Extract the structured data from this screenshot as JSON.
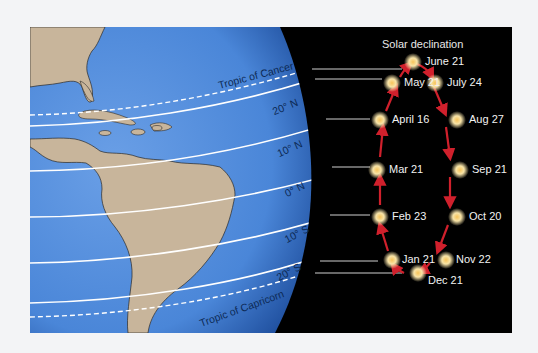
{
  "diagram": {
    "title": "Solar declination",
    "colors": {
      "background": "#000000",
      "ocean": "#4a86d8",
      "land": "#c8b59b",
      "arrow": "#d0202c",
      "sun": "#f4d27a",
      "latitude_line": "#ffffff"
    },
    "latitude_labels": [
      {
        "id": "tropic-cancer",
        "text": "Tropic of Cancer"
      },
      {
        "id": "lat-20n",
        "text": "20° N"
      },
      {
        "id": "lat-10n",
        "text": "10° N"
      },
      {
        "id": "lat-0n",
        "text": "0° N"
      },
      {
        "id": "lat-10s",
        "text": "10° S"
      },
      {
        "id": "lat-20s",
        "text": "20° S"
      },
      {
        "id": "tropic-capricorn",
        "text": "Tropic of Capricorn"
      }
    ],
    "suns": [
      {
        "id": "june21",
        "label": "June 21"
      },
      {
        "id": "may21",
        "label": "May 21"
      },
      {
        "id": "july24",
        "label": "July 24"
      },
      {
        "id": "april16",
        "label": "April 16"
      },
      {
        "id": "aug27",
        "label": "Aug 27"
      },
      {
        "id": "mar21",
        "label": "Mar 21"
      },
      {
        "id": "sep21",
        "label": "Sep 21"
      },
      {
        "id": "feb23",
        "label": "Feb 23"
      },
      {
        "id": "oct20",
        "label": "Oct 20"
      },
      {
        "id": "jan21",
        "label": "Jan 21"
      },
      {
        "id": "nov22",
        "label": "Nov 22"
      },
      {
        "id": "dec21",
        "label": "Dec 21"
      }
    ]
  }
}
